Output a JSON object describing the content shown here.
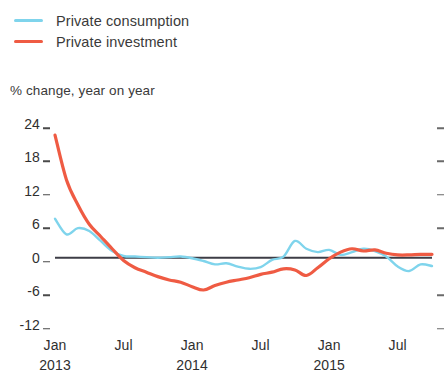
{
  "legend": {
    "items": [
      {
        "label": "Private consumption",
        "color": "#7fd4ec",
        "swatch_name": "legend-swatch-consumption"
      },
      {
        "label": "Private investment",
        "color": "#ef5b43",
        "swatch_name": "legend-swatch-investment"
      }
    ]
  },
  "axis_caption": "% change, year on year",
  "chart_data": {
    "type": "line",
    "title": "",
    "subtitle": "",
    "xlabel": "",
    "ylabel": "% change, year on year",
    "ylim": [
      -12,
      24
    ],
    "xlim": [
      0,
      33
    ],
    "grid": false,
    "zero_line": true,
    "legend_position": "top-left",
    "y_ticks": [
      24,
      18,
      12,
      6,
      0,
      -6,
      -12
    ],
    "y_tick_labels": [
      "24",
      "18",
      "12",
      "6",
      "0",
      "-6",
      "-12"
    ],
    "x_tick_labels": [
      "Jan",
      "Jul",
      "Jan",
      "Jul",
      "Jan",
      "Jul"
    ],
    "x_tick_years": [
      "2013",
      "",
      "2014",
      "",
      "2015",
      ""
    ],
    "x_tick_index": [
      0,
      6,
      12,
      18,
      24,
      30
    ],
    "x_axis_note": "monthly observations, Jan 2013 through Aug 2015",
    "series": [
      {
        "name": "Private consumption",
        "color": "#7fd4ec",
        "values": [
          7.0,
          4.2,
          5.3,
          4.8,
          3.0,
          1.2,
          0.3,
          0.2,
          0.1,
          0.0,
          0.1,
          0.2,
          -0.1,
          -0.6,
          -1.2,
          -1.0,
          -1.6,
          -2.0,
          -1.7,
          -0.4,
          0.2,
          3.0,
          1.6,
          1.0,
          1.4,
          0.5,
          1.0,
          1.6,
          1.2,
          0.2,
          -1.6,
          -2.4,
          -1.2,
          -1.5
        ]
      },
      {
        "name": "Private investment",
        "color": "#ef5b43",
        "values": [
          22.0,
          14.0,
          9.5,
          6.0,
          3.8,
          1.6,
          -0.5,
          -1.8,
          -2.6,
          -3.4,
          -4.0,
          -4.4,
          -5.2,
          -5.8,
          -5.0,
          -4.4,
          -4.0,
          -3.6,
          -3.0,
          -2.6,
          -2.0,
          -2.2,
          -3.2,
          -1.8,
          -0.2,
          1.0,
          1.6,
          1.2,
          1.4,
          0.8,
          0.5,
          0.5,
          0.6,
          0.6
        ]
      }
    ]
  },
  "geometry": {
    "plot_left": 55,
    "plot_right": 432,
    "y_top_value": 24,
    "y_top_px": 124,
    "px_per_unit": 5.57
  }
}
